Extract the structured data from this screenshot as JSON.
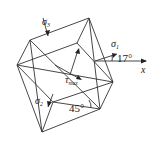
{
  "diagram": {
    "type": "stress element rotated (principal stress directions)",
    "labels": {
      "sigma3": "σ",
      "sigma3_sub": "3",
      "sigma1": "σ",
      "sigma1_sub": "1",
      "sigma2": "σ",
      "sigma2_sub": "2",
      "tau": "τ",
      "tau_sub": "max",
      "x_axis": "x",
      "angle_17": "17°",
      "angle_45": "45°"
    },
    "colors": {
      "line": "#333333",
      "text": "#222222"
    }
  }
}
